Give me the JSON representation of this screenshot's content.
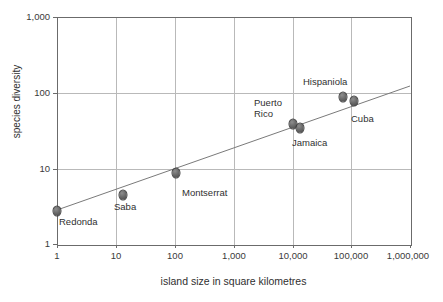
{
  "chart_data": {
    "type": "scatter",
    "title": "",
    "xlabel": "island size in square kilometres",
    "ylabel": "species diversity",
    "xscale": "log",
    "yscale": "log",
    "xlim": [
      1,
      1000000
    ],
    "ylim": [
      1,
      1000
    ],
    "grid": true,
    "legend": "none",
    "xticklabels": [
      "1",
      "10",
      "100",
      "1,000",
      "10,000",
      "100,000",
      "1,000,000"
    ],
    "xtickvalues": [
      1,
      10,
      100,
      1000,
      10000,
      100000,
      1000000
    ],
    "yticklabels": [
      "1",
      "10",
      "100",
      "1,000"
    ],
    "ytickvalues": [
      1,
      10,
      100,
      1000
    ],
    "points": [
      {
        "name": "Redonda",
        "x": 1,
        "y": 2.7,
        "label": "Redonda",
        "px": 57,
        "py": 211,
        "lx": 59,
        "ly": 216
      },
      {
        "name": "Saba",
        "x": 13,
        "y": 4.4,
        "label": "Saba",
        "px": 123,
        "py": 195,
        "lx": 114,
        "ly": 201
      },
      {
        "name": "Montserrat",
        "x": 102,
        "y": 9,
        "label": "Montserrat",
        "px": 176,
        "py": 173,
        "lx": 182,
        "ly": 187
      },
      {
        "name": "Puerto Rico",
        "x": 8900,
        "y": 37,
        "label": "Puerto\nRico",
        "px": 293,
        "py": 124,
        "lx": 254,
        "ly": 97
      },
      {
        "name": "Jamaica",
        "x": 11000,
        "y": 34,
        "label": "Jamaica",
        "px": 300,
        "py": 128,
        "lx": 292,
        "ly": 137
      },
      {
        "name": "Hispaniola",
        "x": 76000,
        "y": 82,
        "label": "Hispaniola",
        "px": 343,
        "py": 97,
        "lx": 303,
        "ly": 76
      },
      {
        "name": "Cuba",
        "x": 110000,
        "y": 75,
        "label": "Cuba",
        "px": 354,
        "py": 101,
        "lx": 351,
        "ly": 113
      }
    ],
    "trendline": {
      "description": "log-log best fit line",
      "x_start": 1,
      "y_start": 2.8,
      "x_end": 1000000,
      "y_end": 120,
      "px_start": 57,
      "py_start": 210,
      "px_end": 410,
      "py_end": 86
    }
  }
}
